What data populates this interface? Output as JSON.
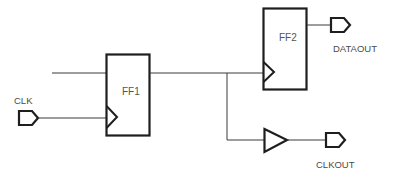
{
  "diagram": {
    "type": "logic-schematic",
    "colors": {
      "line": "#1e1e1e",
      "text": "#4a4a4a",
      "background": "#ffffff"
    },
    "blocks": [
      {
        "id": "ff1",
        "label": "FF1",
        "kind": "flip-flop"
      },
      {
        "id": "ff2",
        "label": "FF2",
        "kind": "flip-flop"
      },
      {
        "id": "buf",
        "label": "",
        "kind": "buffer"
      }
    ],
    "ports": [
      {
        "id": "clk",
        "label": "CLK",
        "direction": "input"
      },
      {
        "id": "dataout",
        "label": "DATAOUT",
        "direction": "output"
      },
      {
        "id": "clkout",
        "label": "CLKOUT",
        "direction": "output"
      }
    ],
    "connections": [
      {
        "from": "external",
        "to": "FF1.D"
      },
      {
        "from": "CLK",
        "to": "FF1.clock"
      },
      {
        "from": "FF1.Q",
        "to": "FF2.clock"
      },
      {
        "from": "FF1.Q",
        "to": "buffer.in"
      },
      {
        "from": "FF2.Q",
        "to": "DATAOUT"
      },
      {
        "from": "buffer.out",
        "to": "CLKOUT"
      }
    ]
  }
}
